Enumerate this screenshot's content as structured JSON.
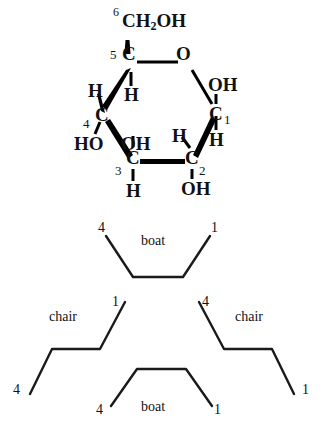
{
  "figure": {
    "ink_color": "#000000",
    "background_color": "#ffffff"
  },
  "haworth": {
    "atoms": {
      "c6_group": "CH",
      "c6_sub": "2",
      "c6_tail": "OH",
      "c5": "C",
      "ring_oxygen": "O",
      "c1": "C",
      "c2": "C",
      "c3": "C",
      "c4": "C",
      "c1_oh": "OH",
      "c1_h": "H",
      "c2_h": "H",
      "c2_oh": "OH",
      "c3_oh": "OH",
      "c3_h": "H",
      "c4_ho": "HO",
      "c4_h": "H",
      "c5_h": "H"
    },
    "locants": {
      "n6": "6",
      "n5": "5",
      "n4": "4",
      "n3": "3",
      "n2": "2",
      "n1": "1"
    }
  },
  "conformations": [
    {
      "id": "boat-top",
      "name": "boat",
      "left_locant": "4",
      "right_locant": "1"
    },
    {
      "id": "chair-left",
      "name": "chair",
      "left_locant": "4",
      "right_locant": "1"
    },
    {
      "id": "chair-right",
      "name": "chair",
      "left_locant": "4",
      "right_locant": "1"
    },
    {
      "id": "boat-bottom",
      "name": "boat",
      "left_locant": "4",
      "right_locant": "1"
    }
  ]
}
